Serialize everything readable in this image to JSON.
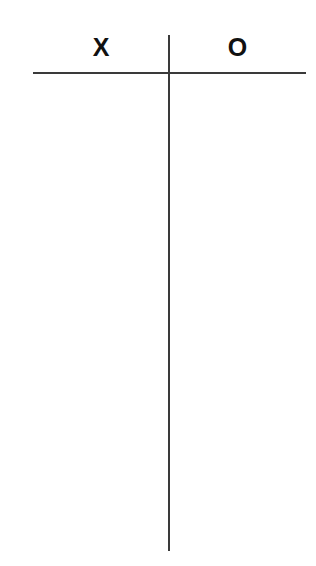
{
  "t_chart": {
    "columns": [
      {
        "label": "X"
      },
      {
        "label": "O"
      }
    ],
    "rows": [],
    "colors": {
      "line": "#3a3a3a",
      "text": "#111111",
      "background": "#ffffff"
    }
  }
}
